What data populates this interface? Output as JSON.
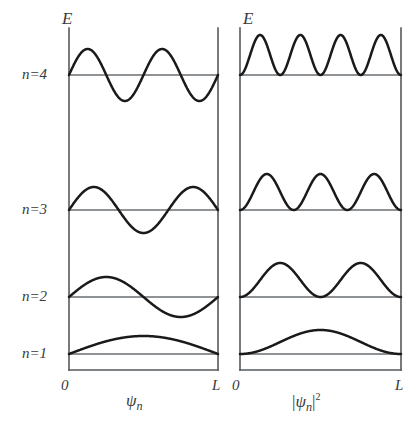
{
  "figure": {
    "background_color": "#ffffff",
    "curve_color": "#1a1a1a",
    "axis_color": "#555a5e",
    "level_color": "#6a6f73",
    "energy_axis_label": "E",
    "origin_label": "0",
    "length_label": "L"
  },
  "panels": [
    {
      "id": "wavefunction-panel",
      "axis_caption_main": "ψ",
      "axis_caption_sub": "n",
      "axis_caption_sup": "",
      "axis_caption_text": "ψn",
      "quantity": "wavefunction"
    },
    {
      "id": "probability-panel",
      "axis_caption_main": "ψ",
      "axis_caption_sub": "n",
      "axis_caption_sup": "2",
      "axis_caption_text": "|ψn|²",
      "quantity": "probability-density"
    }
  ],
  "levels": [
    {
      "label": "n=1",
      "n": 1
    },
    {
      "label": "n=2",
      "n": 2
    },
    {
      "label": "n=3",
      "n": 3
    },
    {
      "label": "n=4",
      "n": 4
    }
  ],
  "chart_data": {
    "type": "line",
    "title": "",
    "xlabel": "",
    "ylabel": "E",
    "grid": false,
    "legend": "none",
    "xlim": [
      0,
      1
    ],
    "xtick_labels": [
      "0",
      "L"
    ],
    "panels": [
      {
        "name": "ψn",
        "description": "Particle-in-a-box wavefunctions: n half-wavelength sine curves about each energy baseline",
        "series": [
          {
            "name": "n=1",
            "n": 1,
            "baseline_y": 354,
            "amplitude": 18,
            "nodes_interior": 0,
            "form": "A*sin(n*pi*x/L)"
          },
          {
            "name": "n=2",
            "n": 2,
            "baseline_y": 297,
            "amplitude": 20,
            "nodes_interior": 1,
            "form": "A*sin(n*pi*x/L)"
          },
          {
            "name": "n=3",
            "n": 3,
            "baseline_y": 210,
            "amplitude": 23,
            "nodes_interior": 2,
            "form": "A*sin(n*pi*x/L)"
          },
          {
            "name": "n=4",
            "n": 4,
            "baseline_y": 75,
            "amplitude": 26,
            "nodes_interior": 3,
            "form": "A*sin(n*pi*x/L)"
          }
        ]
      },
      {
        "name": "|ψn|²",
        "description": "Probability densities: n positive lobes resting on each energy baseline",
        "series": [
          {
            "name": "n=1",
            "n": 1,
            "baseline_y": 354,
            "amplitude": 24,
            "lobes": 1,
            "form": "A*sin(n*pi*x/L)^2"
          },
          {
            "name": "n=2",
            "n": 2,
            "baseline_y": 297,
            "amplitude": 34,
            "lobes": 2,
            "form": "A*sin(n*pi*x/L)^2"
          },
          {
            "name": "n=3",
            "n": 3,
            "baseline_y": 210,
            "amplitude": 36,
            "lobes": 3,
            "form": "A*sin(n*pi*x/L)^2"
          },
          {
            "name": "n=4",
            "n": 4,
            "baseline_y": 75,
            "amplitude": 40,
            "lobes": 4,
            "form": "A*sin(n*pi*x/L)^2"
          }
        ]
      }
    ],
    "energy_levels": {
      "labels": [
        "n=1",
        "n=2",
        "n=3",
        "n=4"
      ],
      "pixel_y": [
        354,
        297,
        210,
        75
      ],
      "spacing_rule": "E_n proportional to n^2"
    }
  }
}
